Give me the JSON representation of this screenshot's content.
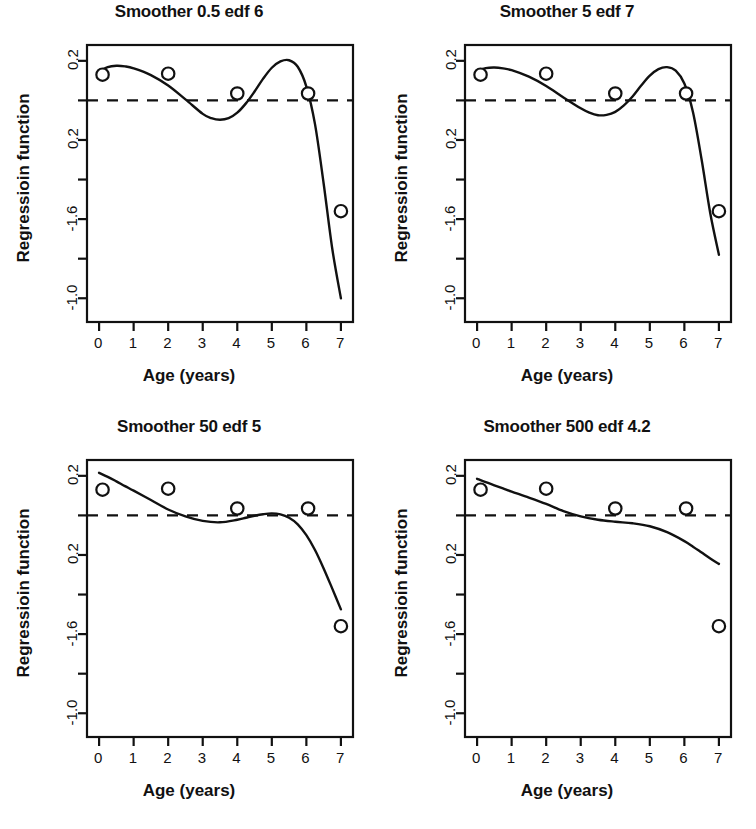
{
  "figure": {
    "width": 756,
    "height": 829,
    "background": "#ffffff",
    "ink": "#111111",
    "layout": "2x2 grid of panels"
  },
  "chart_data": [
    {
      "type": "scatter",
      "title": "Smoother 0.5 edf 6",
      "xlabel": "Age (years)",
      "ylabel": "Regressioin function",
      "xlim": [
        -0.35,
        7.35
      ],
      "ylim": [
        -1.12,
        0.28
      ],
      "xticks": [
        0,
        1,
        2,
        3,
        4,
        5,
        6,
        7
      ],
      "xtick_labels": [
        "0",
        "1",
        "2",
        "3",
        "4",
        "5",
        "6",
        "7"
      ],
      "yticks": [
        0.2,
        -0.0,
        -0.2,
        -0.4,
        -0.6,
        -0.8,
        -1.0
      ],
      "ytick_labels": [
        "0.2",
        "",
        "0.2",
        "",
        "-1.6",
        "",
        "-1.0"
      ],
      "grid": false,
      "legend": "none",
      "reference_line": {
        "y": 0.0,
        "style": "dashed"
      },
      "points": {
        "x": [
          0.1,
          2.0,
          4.0,
          6.05,
          7.0
        ],
        "y": [
          0.13,
          0.135,
          0.035,
          0.035,
          -0.56
        ]
      },
      "curve": {
        "x": [
          0.0,
          0.25,
          0.5,
          0.75,
          1.0,
          1.5,
          2.0,
          2.5,
          3.0,
          3.25,
          3.5,
          3.75,
          4.0,
          4.25,
          4.5,
          4.75,
          5.0,
          5.25,
          5.5,
          5.75,
          6.0,
          6.25,
          6.5,
          6.75,
          7.0
        ],
        "y": [
          0.145,
          0.168,
          0.175,
          0.172,
          0.162,
          0.128,
          0.075,
          0.005,
          -0.068,
          -0.09,
          -0.098,
          -0.09,
          -0.062,
          -0.015,
          0.045,
          0.11,
          0.165,
          0.197,
          0.203,
          0.17,
          0.07,
          -0.12,
          -0.42,
          -0.75,
          -1.0
        ]
      }
    },
    {
      "type": "scatter",
      "title": "Smoother 5 edf 7",
      "xlabel": "Age (years)",
      "ylabel": "Regressioin function",
      "xlim": [
        -0.35,
        7.35
      ],
      "ylim": [
        -1.12,
        0.28
      ],
      "xticks": [
        0,
        1,
        2,
        3,
        4,
        5,
        6,
        7
      ],
      "xtick_labels": [
        "0",
        "1",
        "2",
        "3",
        "4",
        "5",
        "6",
        "7"
      ],
      "yticks": [
        0.2,
        -0.0,
        -0.2,
        -0.4,
        -0.6,
        -0.8,
        -1.0
      ],
      "ytick_labels": [
        "0.2",
        "",
        "0.2",
        "",
        "-1.6",
        "",
        "-1.0"
      ],
      "grid": false,
      "legend": "none",
      "reference_line": {
        "y": 0.0,
        "style": "dashed"
      },
      "points": {
        "x": [
          0.1,
          2.0,
          4.0,
          6.05,
          7.0
        ],
        "y": [
          0.13,
          0.135,
          0.035,
          0.035,
          -0.56
        ]
      },
      "curve": {
        "x": [
          0.0,
          0.25,
          0.5,
          0.75,
          1.0,
          1.5,
          2.0,
          2.5,
          3.0,
          3.25,
          3.5,
          3.75,
          4.0,
          4.25,
          4.5,
          4.75,
          5.0,
          5.25,
          5.5,
          5.75,
          6.0,
          6.25,
          6.5,
          6.75,
          7.0
        ],
        "y": [
          0.15,
          0.163,
          0.166,
          0.162,
          0.153,
          0.12,
          0.073,
          0.015,
          -0.04,
          -0.062,
          -0.075,
          -0.073,
          -0.058,
          -0.025,
          0.02,
          0.075,
          0.125,
          0.158,
          0.168,
          0.15,
          0.085,
          -0.06,
          -0.3,
          -0.57,
          -0.78
        ]
      }
    },
    {
      "type": "scatter",
      "title": "Smoother 50 edf 5",
      "xlabel": "Age (years)",
      "ylabel": "Regressioin function",
      "xlim": [
        -0.35,
        7.35
      ],
      "ylim": [
        -1.12,
        0.28
      ],
      "xticks": [
        0,
        1,
        2,
        3,
        4,
        5,
        6,
        7
      ],
      "xtick_labels": [
        "0",
        "1",
        "2",
        "3",
        "4",
        "5",
        "6",
        "7"
      ],
      "yticks": [
        0.2,
        -0.0,
        -0.2,
        -0.4,
        -0.6,
        -0.8,
        -1.0
      ],
      "ytick_labels": [
        "0.2",
        "",
        "0.2",
        "",
        "-1.6",
        "",
        "-1.0"
      ],
      "grid": false,
      "legend": "none",
      "reference_line": {
        "y": 0.0,
        "style": "dashed"
      },
      "points": {
        "x": [
          0.1,
          2.0,
          4.0,
          6.05,
          7.0
        ],
        "y": [
          0.13,
          0.135,
          0.035,
          0.035,
          -0.56
        ]
      },
      "curve": {
        "x": [
          0.0,
          0.25,
          0.5,
          0.75,
          1.0,
          1.5,
          2.0,
          2.5,
          3.0,
          3.5,
          4.0,
          4.25,
          4.5,
          4.75,
          5.0,
          5.25,
          5.5,
          5.75,
          6.0,
          6.25,
          6.5,
          6.75,
          7.0
        ],
        "y": [
          0.215,
          0.195,
          0.172,
          0.148,
          0.125,
          0.078,
          0.03,
          -0.005,
          -0.028,
          -0.035,
          -0.022,
          -0.012,
          -0.002,
          0.006,
          0.01,
          0.005,
          -0.012,
          -0.045,
          -0.1,
          -0.175,
          -0.268,
          -0.37,
          -0.475
        ]
      }
    },
    {
      "type": "scatter",
      "title": "Smoother 500 edf 4.2",
      "xlabel": "Age (years)",
      "ylabel": "Regressioin function",
      "xlim": [
        -0.35,
        7.35
      ],
      "ylim": [
        -1.12,
        0.28
      ],
      "xticks": [
        0,
        1,
        2,
        3,
        4,
        5,
        6,
        7
      ],
      "xtick_labels": [
        "0",
        "1",
        "2",
        "3",
        "4",
        "5",
        "6",
        "7"
      ],
      "yticks": [
        0.2,
        -0.0,
        -0.2,
        -0.4,
        -0.6,
        -0.8,
        -1.0
      ],
      "ytick_labels": [
        "0.2",
        "",
        "0.2",
        "",
        "-1.6",
        "",
        "-1.0"
      ],
      "grid": false,
      "legend": "none",
      "reference_line": {
        "y": 0.0,
        "style": "dashed"
      },
      "points": {
        "x": [
          0.1,
          2.0,
          4.0,
          6.05,
          7.0
        ],
        "y": [
          0.13,
          0.135,
          0.035,
          0.035,
          -0.56
        ]
      },
      "curve": {
        "x": [
          0.0,
          0.25,
          0.5,
          0.75,
          1.0,
          1.5,
          2.0,
          2.5,
          3.0,
          3.5,
          4.0,
          4.5,
          5.0,
          5.5,
          6.0,
          6.25,
          6.5,
          6.75,
          7.0
        ],
        "y": [
          0.185,
          0.168,
          0.152,
          0.136,
          0.12,
          0.09,
          0.058,
          0.022,
          -0.005,
          -0.022,
          -0.032,
          -0.04,
          -0.055,
          -0.085,
          -0.13,
          -0.158,
          -0.188,
          -0.218,
          -0.245
        ]
      }
    }
  ],
  "panels": [
    {
      "id": "panel-1",
      "title": "Smoother 0.5 edf 6",
      "xlabel": "Age (years)",
      "ylabel": "Regressioin function"
    },
    {
      "id": "panel-2",
      "title": "Smoother 5 edf 7",
      "xlabel": "Age (years)",
      "ylabel": "Regressioin function"
    },
    {
      "id": "panel-3",
      "title": "Smoother 50 edf 5",
      "xlabel": "Age (years)",
      "ylabel": "Regressioin function"
    },
    {
      "id": "panel-4",
      "title": "Smoother 500 edf 4.2",
      "xlabel": "Age (years)",
      "ylabel": "Regressioin function"
    }
  ]
}
